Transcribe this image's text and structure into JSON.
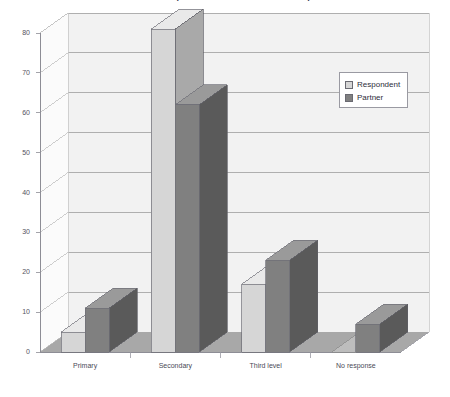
{
  "chart": {
    "title": "Education of Respondents and Partners of Respondents",
    "legend_position": "top-right"
  },
  "axis": {
    "y_ticks": [
      "0",
      "10",
      "20",
      "30",
      "40",
      "50",
      "60",
      "70",
      "80"
    ]
  },
  "legend": {
    "items": [
      {
        "label": "Respondent",
        "color": "#d3d3d3"
      },
      {
        "label": "Partner",
        "color": "#808080"
      }
    ]
  },
  "colors": {
    "respondent_front": "#d6d6d6",
    "respondent_top": "#e9e9e9",
    "respondent_side": "#a9a9a9",
    "partner_front": "#808080",
    "partner_top": "#9a9a9a",
    "partner_side": "#5a5a5a",
    "wall": "#f2f2f2",
    "floor": "#a8a8a8",
    "gridline": "#9e9e9e"
  },
  "chart_data": {
    "type": "bar",
    "title": "Education of Respondents and Partners of Respondents",
    "xlabel": "",
    "ylabel": "",
    "ylim": [
      0,
      80
    ],
    "ytick_step": 10,
    "grid": true,
    "legend": "top-right",
    "categories": [
      "Primary",
      "Secondary",
      "Third level",
      "No response"
    ],
    "series": [
      {
        "name": "Respondent",
        "values": [
          5,
          81,
          17,
          0
        ]
      },
      {
        "name": "Partner",
        "values": [
          11,
          62,
          23,
          7
        ]
      }
    ]
  }
}
